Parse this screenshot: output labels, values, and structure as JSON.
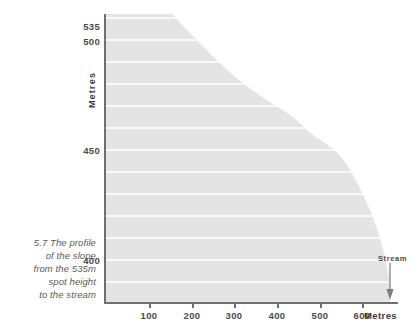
{
  "caption": {
    "lines": [
      "5.7 The profile",
      "of the slope",
      "from the 535m",
      "spot height",
      "to the stream"
    ],
    "text": "5.7 The profile of the slope from the 535m spot height to the stream"
  },
  "axes": {
    "y_title": "Metres",
    "x_title": "Metres",
    "y_ticks": [
      "535",
      "500",
      "450",
      "400"
    ],
    "x_ticks": [
      "100",
      "200",
      "300",
      "400",
      "500",
      "600"
    ]
  },
  "annotations": {
    "stream_label": "Stream",
    "stream_arrow_icon": "down-arrow-icon"
  },
  "colors": {
    "fill": "#e4e4e4",
    "gridline": "#ffffff",
    "axis": "#6f6f6f",
    "text": "#4a4a4a",
    "caption_text": "#5b5b5b"
  },
  "chart_data": {
    "type": "area",
    "title": "5.7 The profile of the slope from the 535m spot height to the stream",
    "xlabel": "Metres",
    "ylabel": "Metres",
    "xlim": [
      0,
      670
    ],
    "ylim": [
      380,
      540
    ],
    "grid": true,
    "gridline_interval": 10,
    "legend": null,
    "x_tick_values": [
      100,
      200,
      300,
      400,
      500,
      600
    ],
    "y_tick_values": [
      400,
      450,
      500,
      535
    ],
    "series": [
      {
        "name": "Slope profile",
        "x": [
          0,
          55,
          95,
          130,
          170,
          215,
          260,
          300,
          345,
          395,
          440,
          470,
          500,
          530,
          560,
          590,
          620,
          645,
          655,
          660
        ],
        "y": [
          535,
          533,
          526,
          517,
          508,
          499,
          490,
          483,
          476,
          470,
          464,
          458,
          454,
          450,
          443,
          432,
          419,
          403,
          392,
          384
        ]
      }
    ],
    "annotations": [
      {
        "label": "Stream",
        "x": 655,
        "y": 384,
        "marker": "down-arrow"
      }
    ]
  }
}
